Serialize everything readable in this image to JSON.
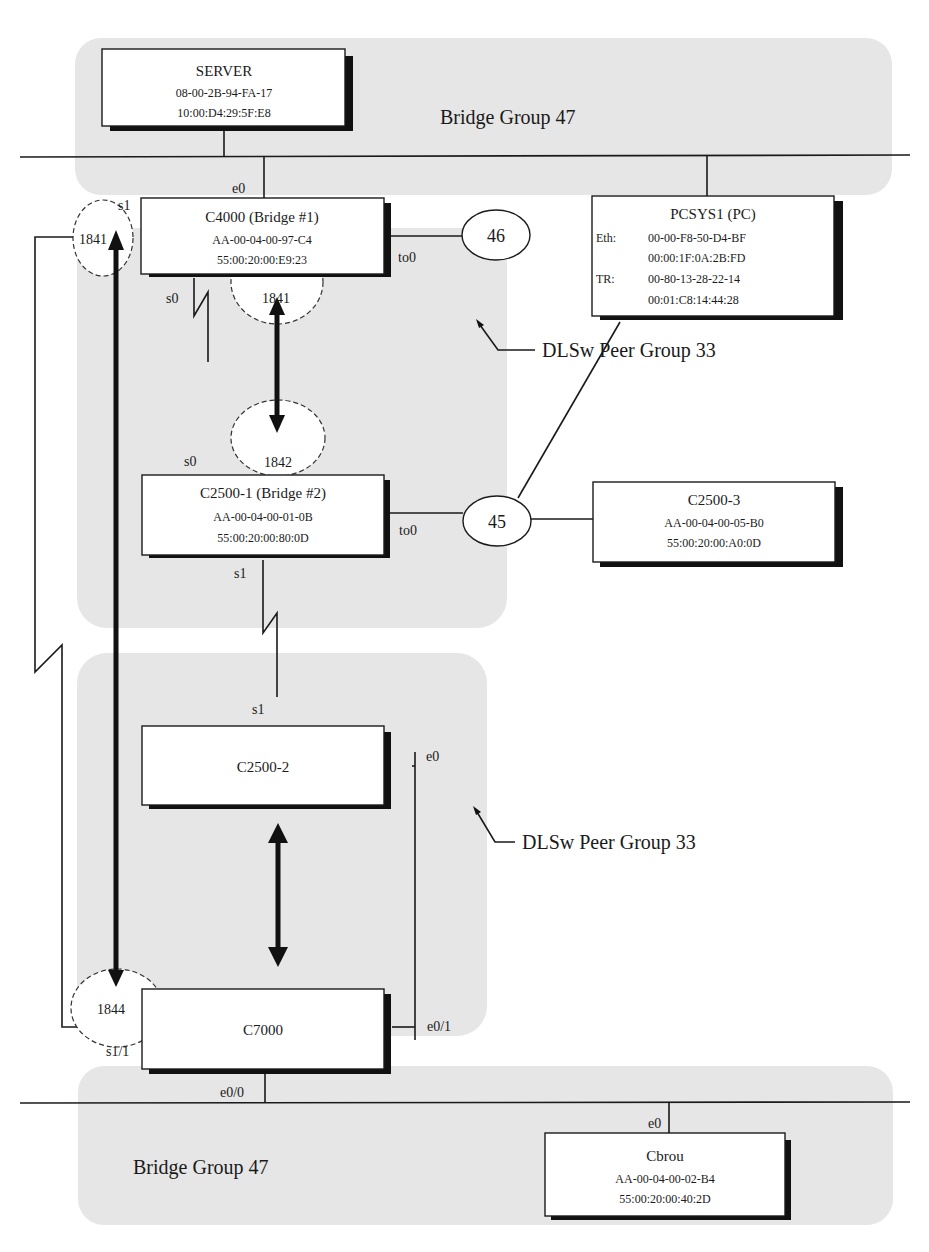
{
  "regions": {
    "bridge_group_top": {
      "label": "Bridge Group 47"
    },
    "bridge_group_bottom": {
      "label": "Bridge Group 47"
    },
    "dlsw_upper": {
      "label": "DLSw Peer Group 33"
    },
    "dlsw_lower": {
      "label": "DLSw Peer Group 33"
    }
  },
  "devices": {
    "server": {
      "name": "SERVER",
      "mac1": "08-00-2B-94-FA-17",
      "mac2": "10:00:D4:29:5F:E8"
    },
    "c4000": {
      "name": "C4000  (Bridge #1)",
      "mac1": "AA-00-04-00-97-C4",
      "mac2": "55:00:20:00:E9:23"
    },
    "pcsys1": {
      "name": "PCSYS1 (PC)",
      "eth_label": "Eth:",
      "eth_mac1": "00-00-F8-50-D4-BF",
      "eth_mac2": "00:00:1F:0A:2B:FD",
      "tr_label": "TR:",
      "tr_mac1": "00-80-13-28-22-14",
      "tr_mac2": "00:01:C8:14:44:28"
    },
    "c2500_1": {
      "name": "C2500-1  (Bridge #2)",
      "mac1": "AA-00-04-00-01-0B",
      "mac2": "55:00:20:00:80:0D"
    },
    "c2500_3": {
      "name": "C2500-3",
      "mac1": "AA-00-04-00-05-B0",
      "mac2": "55:00:20:00:A0:0D"
    },
    "c2500_2": {
      "name": "C2500-2"
    },
    "c7000": {
      "name": "C7000"
    },
    "cbrou": {
      "name": "Cbrou",
      "mac1": "AA-00-04-00-02-B4",
      "mac2": "55:00:20:00:40:2D"
    }
  },
  "rings": {
    "ring46": "46",
    "ring45": "45"
  },
  "peer_ports": {
    "c4000_s1": "1841",
    "c4000_bottom": "1841",
    "c2500_1_top": "1842",
    "c7000": "1844"
  },
  "interfaces": {
    "c4000_e0": "e0",
    "c4000_s1": "s1",
    "c4000_s0": "s0",
    "c4000_to0": "to0",
    "c2500_1_s0": "s0",
    "c2500_1_to0": "to0",
    "c2500_1_s1": "s1",
    "c2500_2_s1": "s1",
    "c2500_2_e0": "e0",
    "c7000_e0_1": "e0/1",
    "c7000_s1_1": "s1/1",
    "c7000_e0_0": "e0/0",
    "cbrou_e0": "e0"
  }
}
